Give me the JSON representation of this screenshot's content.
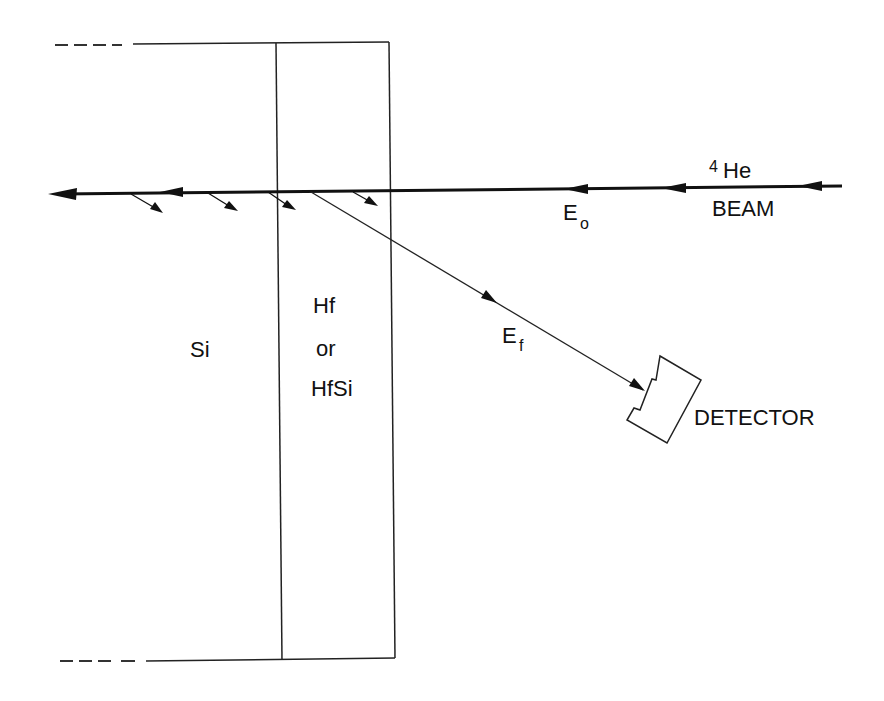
{
  "diagram": {
    "type": "Rutherford backscattering geometry schematic",
    "colors": {
      "ink": "#111111",
      "background": "#ffffff"
    },
    "regions": {
      "substrate": {
        "label": "Si"
      },
      "film": {
        "line1": "Hf",
        "line2": "or",
        "line3": "HfSi"
      }
    },
    "beam": {
      "species_mass": "4",
      "species": "He",
      "label": "BEAM",
      "incident_energy": {
        "main": "E",
        "sub": "o"
      }
    },
    "scattered": {
      "final_energy": {
        "main": "E",
        "sub": "f"
      }
    },
    "detector": {
      "label": "DETECTOR"
    }
  }
}
